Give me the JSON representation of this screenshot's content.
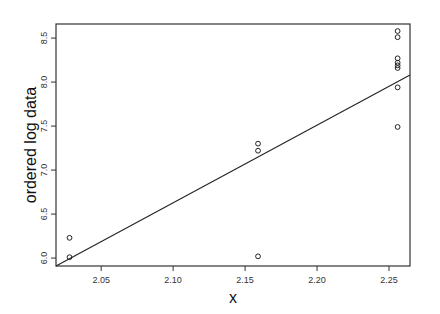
{
  "chart_data": {
    "type": "scatter",
    "title": "",
    "xlabel": "x",
    "ylabel": "ordered log data",
    "xlim": [
      2.0186,
      2.2646
    ],
    "ylim": [
      5.91,
      8.66
    ],
    "x_ticks": [
      2.05,
      2.1,
      2.15,
      2.2,
      2.25
    ],
    "x_tick_labels": [
      "2.05",
      "2.10",
      "2.15",
      "2.20",
      "2.25"
    ],
    "y_ticks": [
      6.0,
      6.5,
      7.0,
      7.5,
      8.0,
      8.5
    ],
    "y_tick_labels": [
      "6.0",
      "6.5",
      "7.0",
      "7.5",
      "8.0",
      "8.5"
    ],
    "grid": false,
    "legend": null,
    "marker": "open-circle",
    "series": [
      {
        "name": "ordered log data",
        "points": [
          {
            "x": 2.028,
            "y": 6.01
          },
          {
            "x": 2.028,
            "y": 6.23
          },
          {
            "x": 2.159,
            "y": 6.02
          },
          {
            "x": 2.159,
            "y": 7.22
          },
          {
            "x": 2.159,
            "y": 7.3
          },
          {
            "x": 2.256,
            "y": 7.49
          },
          {
            "x": 2.256,
            "y": 7.94
          },
          {
            "x": 2.256,
            "y": 8.16
          },
          {
            "x": 2.256,
            "y": 8.19
          },
          {
            "x": 2.256,
            "y": 8.22
          },
          {
            "x": 2.256,
            "y": 8.27
          },
          {
            "x": 2.256,
            "y": 8.51
          },
          {
            "x": 2.256,
            "y": 8.58
          }
        ]
      }
    ],
    "fit_line": {
      "name": "reference line",
      "from": {
        "x": 2.0186,
        "y": 5.91
      },
      "to": {
        "x": 2.2646,
        "y": 8.08
      }
    }
  }
}
